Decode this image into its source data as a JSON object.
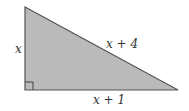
{
  "figure": {
    "shape": "right-triangle",
    "fill_color": "#b8b8b8",
    "stroke_color": "#555555",
    "labels": {
      "left_side": "x",
      "hypotenuse": "x + 4",
      "bottom_side": "x + 1"
    },
    "right_angle_marker": true
  }
}
